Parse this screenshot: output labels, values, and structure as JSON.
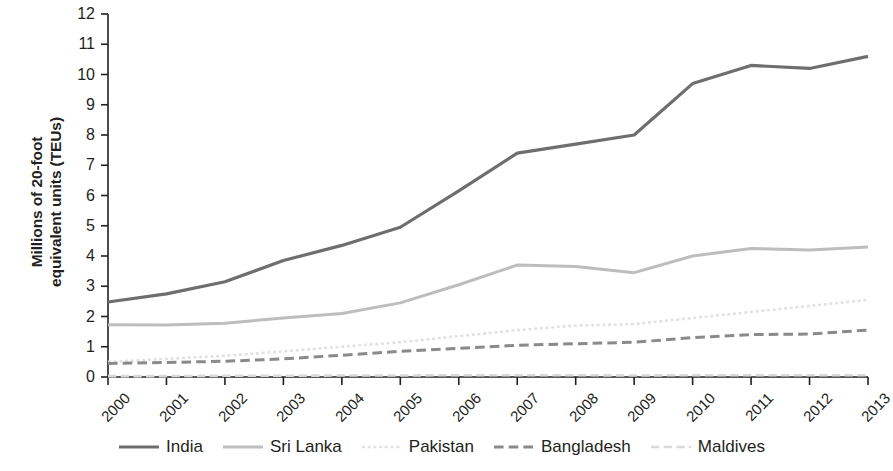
{
  "chart_data": {
    "type": "line",
    "title": "",
    "xlabel": "",
    "ylabel": "Millions of 20-foot equivalent units (TEUs)",
    "ylabel_line1": "Millions of 20-foot",
    "ylabel_line2": "equivalent units (TEUs)",
    "categories": [
      "2000",
      "2001",
      "2002",
      "2003",
      "2004",
      "2005",
      "2006",
      "2007",
      "2008",
      "2009",
      "2010",
      "2011",
      "2012",
      "2013"
    ],
    "x": [
      2000,
      2001,
      2002,
      2003,
      2004,
      2005,
      2006,
      2007,
      2008,
      2009,
      2010,
      2011,
      2012,
      2013
    ],
    "xlim": [
      2000,
      2013
    ],
    "ylim": [
      0,
      12
    ],
    "yticks": [
      0,
      1,
      2,
      3,
      4,
      5,
      6,
      7,
      8,
      9,
      10,
      11,
      12
    ],
    "ytick_labels": [
      "0",
      "1",
      "2",
      "3",
      "4",
      "5",
      "6",
      "7",
      "8",
      "9",
      "10",
      "11",
      "12"
    ],
    "grid": false,
    "legend_position": "bottom",
    "series": [
      {
        "name": "India",
        "style": "solid",
        "color": "#6e6e6e",
        "width": 3.2,
        "values": [
          2.48,
          2.75,
          3.15,
          3.85,
          4.35,
          4.95,
          6.15,
          7.4,
          7.7,
          8.0,
          9.7,
          10.3,
          10.2,
          10.6
        ]
      },
      {
        "name": "Sri Lanka",
        "style": "solid",
        "color": "#bdbdbd",
        "width": 3.0,
        "values": [
          1.73,
          1.72,
          1.78,
          1.95,
          2.1,
          2.45,
          3.05,
          3.7,
          3.65,
          3.45,
          4.0,
          4.25,
          4.2,
          4.3
        ]
      },
      {
        "name": "Pakistan",
        "style": "dotted",
        "color": "#e2e2e2",
        "width": 2.6,
        "values": [
          0.5,
          0.6,
          0.7,
          0.85,
          1.0,
          1.15,
          1.35,
          1.55,
          1.7,
          1.75,
          1.95,
          2.15,
          2.35,
          2.55
        ]
      },
      {
        "name": "Bangladesh",
        "style": "dashed",
        "color": "#8a8a8a",
        "width": 3.0,
        "values": [
          0.45,
          0.48,
          0.52,
          0.6,
          0.72,
          0.85,
          0.95,
          1.05,
          1.1,
          1.15,
          1.3,
          1.4,
          1.42,
          1.55
        ]
      },
      {
        "name": "Maldives",
        "style": "dashed",
        "color": "#d9d9d9",
        "width": 2.6,
        "values": [
          0.03,
          0.03,
          0.04,
          0.04,
          0.05,
          0.05,
          0.06,
          0.06,
          0.06,
          0.05,
          0.06,
          0.06,
          0.06,
          0.06
        ]
      }
    ]
  },
  "axis": {
    "color": "#231f20"
  }
}
